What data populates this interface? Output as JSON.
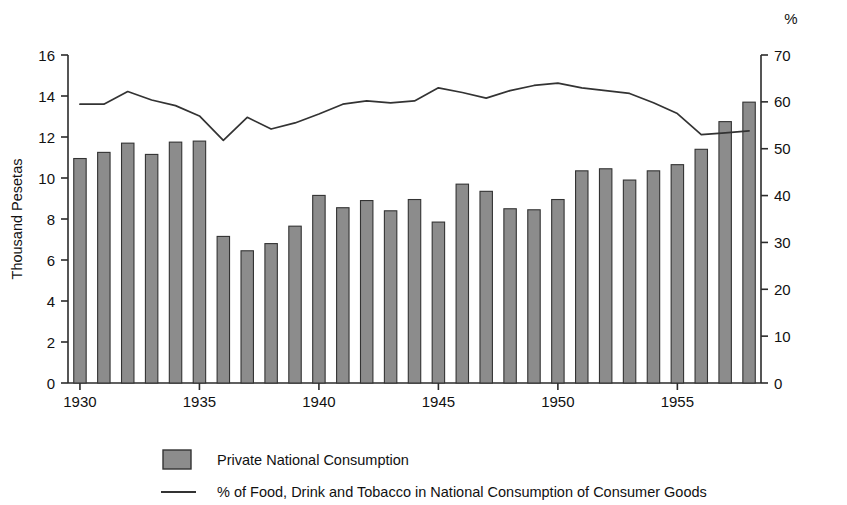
{
  "chart_data": {
    "type": "bar",
    "title": "",
    "subtitle": "",
    "xlabel": "",
    "ylabel": "Thousand Pesetas",
    "y2label": "%",
    "grid": false,
    "legend_position": "bottom-left",
    "xlim": [
      1929.5,
      1958.5
    ],
    "ylim": [
      0,
      16
    ],
    "y2lim": [
      0,
      70
    ],
    "xticks": [
      1930,
      1935,
      1940,
      1945,
      1950,
      1955
    ],
    "xtick_labels": [
      "1930",
      "1935",
      "1940",
      "1945",
      "1950",
      "1955"
    ],
    "yticks": [
      0,
      2,
      4,
      6,
      8,
      10,
      12,
      14,
      16
    ],
    "ytick_labels": [
      "0",
      "2",
      "4",
      "6",
      "8",
      "10",
      "12",
      "14",
      "16"
    ],
    "y2ticks": [
      0,
      10,
      20,
      30,
      40,
      50,
      60,
      70
    ],
    "y2tick_labels": [
      "0",
      "10",
      "20",
      "30",
      "40",
      "50",
      "60",
      "70"
    ],
    "x": [
      1930,
      1931,
      1932,
      1933,
      1934,
      1935,
      1936,
      1937,
      1938,
      1939,
      1940,
      1941,
      1942,
      1943,
      1944,
      1945,
      1946,
      1947,
      1948,
      1949,
      1950,
      1951,
      1952,
      1953,
      1954,
      1955,
      1956,
      1957,
      1958
    ],
    "series": [
      {
        "name": "Private National Consumption",
        "type": "bar",
        "axis": "left",
        "units": "Thousand Pesetas",
        "color": "#8c8c8c",
        "edge_color": "#333333",
        "values": [
          10.95,
          11.25,
          11.7,
          11.15,
          11.75,
          11.8,
          7.15,
          6.45,
          6.8,
          7.65,
          9.15,
          8.55,
          8.9,
          8.4,
          8.95,
          7.85,
          9.7,
          9.35,
          8.5,
          8.45,
          8.95,
          10.35,
          10.45,
          9.9,
          10.35,
          10.65,
          11.4,
          12.75,
          13.7
        ]
      },
      {
        "name": "% of Food, Drink and Tobacco in National Consumption of Consumer Goods",
        "type": "line",
        "axis": "right",
        "units": "%",
        "color": "#333333",
        "values": [
          59.5,
          59.5,
          62.2,
          60.4,
          59.2,
          57.0,
          51.8,
          56.7,
          54.2,
          55.5,
          57.4,
          59.5,
          60.2,
          59.8,
          60.2,
          63.0,
          62.0,
          60.8,
          62.4,
          63.5,
          64.0,
          63.0,
          62.4,
          61.8,
          59.8,
          57.5,
          53.0,
          53.4,
          53.8
        ]
      }
    ]
  },
  "legend": {
    "items": [
      {
        "label": "Private National Consumption",
        "marker": "swatch"
      },
      {
        "label": "% of Food, Drink and Tobacco in National Consumption of Consumer Goods",
        "marker": "line"
      }
    ]
  },
  "axes": {
    "left_title": "Thousand Pesetas",
    "right_title": "%"
  }
}
